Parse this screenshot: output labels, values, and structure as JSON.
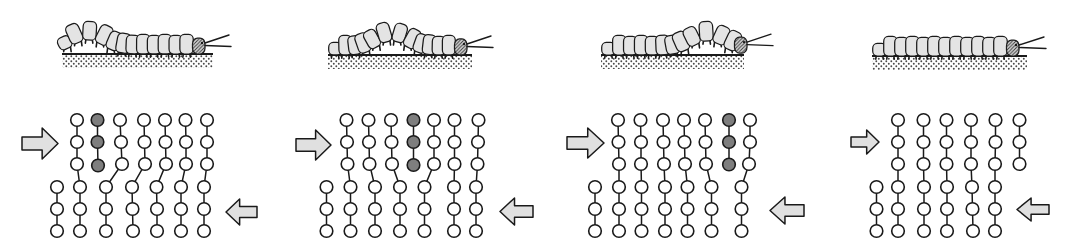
{
  "figure": {
    "width": 1077,
    "height": 251,
    "colors": {
      "background": "#ffffff",
      "line": "#1a1a1a",
      "body_fill": "#e4e4e4",
      "head_fill": "#d6d6d6",
      "atom_fill": "#ffffff",
      "dark_atom_fill": "#7e7e7e",
      "arrow_fill": "#e0e0e0",
      "ground_dot": "#4a4a4a"
    },
    "atom_radius": 6.3,
    "panels": [
      {
        "name": "stage-1",
        "caterpillar": {
          "x0": 62,
          "x1": 206,
          "ground_y": 53,
          "segments": 12,
          "hump_center": 0.2,
          "hump_height": 14,
          "hump_sigma": 1.4,
          "antenna_len": 24
        },
        "ground": {
          "x0": 62,
          "x1": 213,
          "y": 53,
          "band_h": 13
        },
        "arrow_in": {
          "x": 22,
          "y": 128,
          "w": 36,
          "h": 31,
          "dir": "right"
        },
        "arrow_out": {
          "x": 226,
          "y": 199,
          "w": 31,
          "h": 26,
          "dir": "left"
        },
        "lattice": {
          "chains": [
            {
              "dark": false,
              "points": [
                [
                  57,
                  187
                ],
                [
                  57,
                  209
                ],
                [
                  57,
                  231
                ]
              ]
            },
            {
              "dark": false,
              "points": [
                [
                  77,
                  120
                ],
                [
                  77,
                  142
                ],
                [
                  77,
                  164
                ],
                [
                  80,
                  187
                ],
                [
                  80,
                  209
                ],
                [
                  80,
                  231
                ]
              ]
            },
            {
              "dark": true,
              "points": [
                [
                  97.5,
                  120
                ],
                [
                  97.5,
                  142
                ],
                [
                  98,
                  165.5
                ]
              ]
            },
            {
              "dark": false,
              "points": [
                [
                  120,
                  120
                ],
                [
                  121,
                  142
                ],
                [
                  122,
                  164
                ],
                [
                  106,
                  187
                ],
                [
                  106,
                  209
                ],
                [
                  106,
                  231
                ]
              ]
            },
            {
              "dark": false,
              "points": [
                [
                  144,
                  120
                ],
                [
                  144.5,
                  142
                ],
                [
                  145,
                  164
                ],
                [
                  132,
                  187
                ],
                [
                  132.5,
                  209
                ],
                [
                  133,
                  231
                ]
              ]
            },
            {
              "dark": false,
              "points": [
                [
                  165,
                  120
                ],
                [
                  165.5,
                  142
                ],
                [
                  166,
                  164
                ],
                [
                  156.5,
                  187
                ],
                [
                  157,
                  209
                ],
                [
                  157,
                  231
                ]
              ]
            },
            {
              "dark": false,
              "points": [
                [
                  185.5,
                  120
                ],
                [
                  186,
                  142
                ],
                [
                  186,
                  164
                ],
                [
                  181,
                  187
                ],
                [
                  181,
                  209
                ],
                [
                  181,
                  231
                ]
              ]
            },
            {
              "dark": false,
              "points": [
                [
                  207,
                  120
                ],
                [
                  207,
                  142
                ],
                [
                  207,
                  164
                ],
                [
                  204,
                  187
                ],
                [
                  204,
                  209
                ],
                [
                  204,
                  231
                ]
              ]
            }
          ]
        }
      },
      {
        "name": "stage-2",
        "caterpillar": {
          "x0": 330,
          "x1": 468,
          "ground_y": 54,
          "segments": 12,
          "hump_center": 0.5,
          "hump_height": 14,
          "hump_sigma": 1.4,
          "antenna_len": 24
        },
        "ground": {
          "x0": 328,
          "x1": 472,
          "y": 54,
          "band_h": 13
        },
        "arrow_in": {
          "x": 296,
          "y": 130,
          "w": 35,
          "h": 30,
          "dir": "right"
        },
        "arrow_out": {
          "x": 500,
          "y": 198,
          "w": 33,
          "h": 27,
          "dir": "left"
        },
        "lattice": {
          "chains": [
            {
              "dark": false,
              "points": [
                [
                  326.5,
                  187
                ],
                [
                  326.5,
                  209
                ],
                [
                  326.5,
                  231
                ]
              ]
            },
            {
              "dark": false,
              "points": [
                [
                  346.5,
                  120
                ],
                [
                  347,
                  142
                ],
                [
                  347.5,
                  164
                ],
                [
                  350.5,
                  187
                ],
                [
                  350.5,
                  209
                ],
                [
                  350.5,
                  231
                ]
              ]
            },
            {
              "dark": false,
              "points": [
                [
                  368.5,
                  120
                ],
                [
                  369,
                  142
                ],
                [
                  369.5,
                  164
                ],
                [
                  375,
                  187
                ],
                [
                  375,
                  209
                ],
                [
                  375,
                  231
                ]
              ]
            },
            {
              "dark": false,
              "points": [
                [
                  391,
                  120
                ],
                [
                  391.5,
                  142
                ],
                [
                  392,
                  164
                ],
                [
                  400,
                  187
                ],
                [
                  400,
                  209
                ],
                [
                  400,
                  231
                ]
              ]
            },
            {
              "dark": true,
              "points": [
                [
                  413.5,
                  120
                ],
                [
                  413.5,
                  142
                ],
                [
                  413.5,
                  165
                ]
              ]
            },
            {
              "dark": false,
              "points": [
                [
                  434,
                  120
                ],
                [
                  434,
                  142
                ],
                [
                  434,
                  164
                ],
                [
                  424.5,
                  187
                ],
                [
                  424.5,
                  209
                ],
                [
                  424.5,
                  231
                ]
              ]
            },
            {
              "dark": false,
              "points": [
                [
                  454.5,
                  120
                ],
                [
                  454.5,
                  142
                ],
                [
                  454.5,
                  164
                ],
                [
                  454,
                  187
                ],
                [
                  454,
                  209
                ],
                [
                  454,
                  231
                ]
              ]
            },
            {
              "dark": false,
              "points": [
                [
                  478.5,
                  120
                ],
                [
                  478,
                  142
                ],
                [
                  477.5,
                  164
                ],
                [
                  476,
                  187
                ],
                [
                  476,
                  209
                ],
                [
                  476,
                  231
                ]
              ]
            }
          ]
        }
      },
      {
        "name": "stage-3",
        "caterpillar": {
          "x0": 603,
          "x1": 748,
          "ground_y": 54,
          "segments": 12,
          "hump_center": 0.8,
          "hump_height": 14,
          "hump_sigma": 1.4,
          "antenna_len": 24
        },
        "ground": {
          "x0": 601,
          "x1": 744,
          "y": 54,
          "band_h": 13
        },
        "arrow_in": {
          "x": 567,
          "y": 128,
          "w": 37,
          "h": 30,
          "dir": "right"
        },
        "arrow_out": {
          "x": 770,
          "y": 197,
          "w": 34,
          "h": 27,
          "dir": "left"
        },
        "lattice": {
          "chains": [
            {
              "dark": false,
              "points": [
                [
                  595,
                  187
                ],
                [
                  595,
                  209
                ],
                [
                  595,
                  231
                ]
              ]
            },
            {
              "dark": false,
              "points": [
                [
                  618,
                  120
                ],
                [
                  618.5,
                  142
                ],
                [
                  619,
                  164
                ],
                [
                  619,
                  187
                ],
                [
                  619,
                  209
                ],
                [
                  619,
                  231
                ]
              ]
            },
            {
              "dark": false,
              "points": [
                [
                  640.5,
                  120
                ],
                [
                  641,
                  142
                ],
                [
                  641,
                  164
                ],
                [
                  641.5,
                  187
                ],
                [
                  641.5,
                  209
                ],
                [
                  641.5,
                  231
                ]
              ]
            },
            {
              "dark": false,
              "points": [
                [
                  663,
                  120
                ],
                [
                  663.5,
                  142
                ],
                [
                  664,
                  164
                ],
                [
                  665,
                  187
                ],
                [
                  665,
                  209
                ],
                [
                  665,
                  231
                ]
              ]
            },
            {
              "dark": false,
              "points": [
                [
                  684,
                  120
                ],
                [
                  684.5,
                  142
                ],
                [
                  685,
                  164
                ],
                [
                  687.5,
                  187
                ],
                [
                  687.5,
                  209
                ],
                [
                  687.5,
                  231
                ]
              ]
            },
            {
              "dark": false,
              "points": [
                [
                  705,
                  120
                ],
                [
                  705.5,
                  142
                ],
                [
                  706,
                  164
                ],
                [
                  711.5,
                  187
                ],
                [
                  711.5,
                  209
                ],
                [
                  711.5,
                  231
                ]
              ]
            },
            {
              "dark": true,
              "points": [
                [
                  729,
                  120
                ],
                [
                  729,
                  142
                ],
                [
                  729,
                  164.5
                ]
              ]
            },
            {
              "dark": false,
              "points": [
                [
                  750,
                  120
                ],
                [
                  750,
                  142
                ],
                [
                  749,
                  164
                ],
                [
                  741.5,
                  187
                ],
                [
                  741.5,
                  209
                ],
                [
                  741.5,
                  231
                ]
              ]
            }
          ]
        }
      },
      {
        "name": "stage-4",
        "caterpillar": {
          "x0": 874,
          "x1": 1020,
          "ground_y": 55,
          "segments": 12,
          "hump_center": null,
          "hump_height": 0,
          "hump_sigma": 1.4,
          "antenna_len": 25
        },
        "ground": {
          "x0": 872,
          "x1": 1027,
          "y": 55,
          "band_h": 13
        },
        "arrow_in": {
          "x": 851,
          "y": 130,
          "w": 28,
          "h": 24,
          "dir": "right"
        },
        "arrow_out": {
          "x": 1017,
          "y": 198,
          "w": 32,
          "h": 23,
          "dir": "left"
        },
        "lattice": {
          "chains": [
            {
              "dark": false,
              "points": [
                [
                  876.5,
                  187
                ],
                [
                  876.5,
                  209
                ],
                [
                  876.5,
                  231
                ]
              ]
            },
            {
              "dark": false,
              "points": [
                [
                  898,
                  120
                ],
                [
                  898,
                  142
                ],
                [
                  898,
                  164
                ],
                [
                  898,
                  187
                ],
                [
                  898,
                  209
                ],
                [
                  898,
                  231
                ]
              ]
            },
            {
              "dark": false,
              "points": [
                [
                  923.5,
                  120
                ],
                [
                  923.5,
                  142
                ],
                [
                  923.5,
                  164
                ],
                [
                  924,
                  187
                ],
                [
                  924,
                  209
                ],
                [
                  924,
                  231
                ]
              ]
            },
            {
              "dark": false,
              "points": [
                [
                  946.5,
                  120
                ],
                [
                  946.5,
                  142
                ],
                [
                  946.5,
                  164
                ],
                [
                  947,
                  187
                ],
                [
                  947,
                  209
                ],
                [
                  947,
                  231
                ]
              ]
            },
            {
              "dark": false,
              "points": [
                [
                  971,
                  120
                ],
                [
                  971,
                  142
                ],
                [
                  971,
                  164
                ],
                [
                  972,
                  187
                ],
                [
                  972.5,
                  209
                ],
                [
                  973,
                  231
                ]
              ]
            },
            {
              "dark": false,
              "points": [
                [
                  995.5,
                  120
                ],
                [
                  995.5,
                  142
                ],
                [
                  995,
                  164
                ],
                [
                  995,
                  187
                ],
                [
                  995,
                  209
                ],
                [
                  995,
                  231
                ]
              ]
            },
            {
              "dark": false,
              "points": [
                [
                  1019.5,
                  120
                ],
                [
                  1019.5,
                  142
                ],
                [
                  1019.5,
                  164
                ]
              ]
            }
          ]
        }
      }
    ]
  }
}
